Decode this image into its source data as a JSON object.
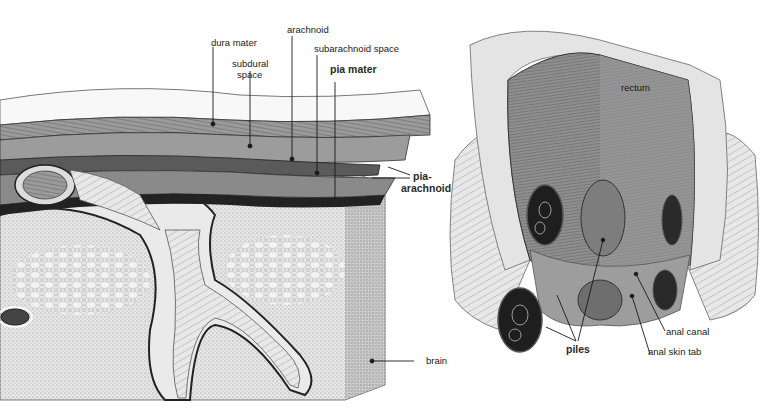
{
  "figures": [
    {
      "id": "meninges",
      "title": "Meninges cross-section",
      "labels": {
        "dura_mater": "dura mater",
        "subdural_space": "subdural\nspace",
        "subdural_line1": "subdural",
        "subdural_line2": "space",
        "arachnoid": "arachnoid",
        "subarachnoid_space": "subarachnoid space",
        "pia_mater": "pia mater",
        "pia_arachnoid_line1": "pia-",
        "pia_arachnoid_line2": "arachnoid",
        "brain": "brain"
      }
    },
    {
      "id": "rectum",
      "title": "Rectum and anal canal",
      "labels": {
        "rectum": "rectum",
        "piles": "piles",
        "anal_canal": "anal canal",
        "anal_skin_tab": "anal skin tab"
      }
    }
  ],
  "colors": {
    "background": "#ffffff",
    "ink": "#1a1a1a",
    "tissue_gray": "#8a8a8a",
    "light_gray": "#c8c8c8",
    "stipple": "#d9d9d9"
  }
}
